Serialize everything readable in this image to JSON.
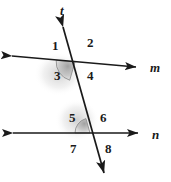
{
  "figure": {
    "canvas": {
      "width": 171,
      "height": 182
    },
    "background_color": "#ffffff",
    "stroke_color": "#1a1a1a",
    "shade_color": "#b9b9b9",
    "shade_edge_color": "#8c8c8c"
  },
  "lines": [
    {
      "id": "line-m",
      "label": "m",
      "label_x": 150,
      "label_y": 61,
      "x1": 12,
      "y1": 56,
      "x2": 136,
      "y2": 67,
      "arrow_start": true,
      "arrow_end": true
    },
    {
      "id": "line-n",
      "label": "n",
      "label_x": 152,
      "label_y": 128,
      "x1": 13,
      "y1": 133,
      "x2": 138,
      "y2": 133,
      "arrow_start": true,
      "arrow_end": true
    },
    {
      "id": "line-t",
      "label": "t",
      "label_x": 60,
      "label_y": 4,
      "x1": 63,
      "y1": 27,
      "x2": 104,
      "y2": 173,
      "arrow_start": true,
      "arrow_end": true
    }
  ],
  "intersections": [
    {
      "id": "intersection-upper",
      "x": 75,
      "y": 62,
      "lines": [
        "line-m",
        "line-t"
      ]
    },
    {
      "id": "intersection-lower",
      "x": 90,
      "y": 133,
      "lines": [
        "line-n",
        "line-t"
      ]
    }
  ],
  "angles": [
    {
      "id": "angle-1",
      "label": "1",
      "x": 52,
      "y": 39,
      "shaded": false,
      "vertex": "intersection-upper",
      "position": "upper-left"
    },
    {
      "id": "angle-2",
      "label": "2",
      "x": 87,
      "y": 36,
      "shaded": false,
      "vertex": "intersection-upper",
      "position": "upper-right"
    },
    {
      "id": "angle-3",
      "label": "3",
      "x": 54,
      "y": 69,
      "shaded": true,
      "vertex": "intersection-upper",
      "position": "lower-left"
    },
    {
      "id": "angle-4",
      "label": "4",
      "x": 87,
      "y": 69,
      "shaded": false,
      "vertex": "intersection-upper",
      "position": "lower-right"
    },
    {
      "id": "angle-5",
      "label": "5",
      "x": 69,
      "y": 111,
      "shaded": true,
      "vertex": "intersection-lower",
      "position": "upper-left"
    },
    {
      "id": "angle-6",
      "label": "6",
      "x": 100,
      "y": 111,
      "shaded": false,
      "vertex": "intersection-lower",
      "position": "upper-right"
    },
    {
      "id": "angle-7",
      "label": "7",
      "x": 70,
      "y": 142,
      "shaded": false,
      "vertex": "intersection-lower",
      "position": "lower-left"
    },
    {
      "id": "angle-8",
      "label": "8",
      "x": 105,
      "y": 142,
      "shaded": false,
      "vertex": "intersection-lower",
      "position": "lower-right"
    }
  ],
  "shaded_sectors": [
    {
      "id": "sector-angle-3",
      "angle_ref": "angle-3",
      "cx": 75,
      "cy": 62,
      "radius": 19,
      "start_deg": 175,
      "end_deg": 254
    },
    {
      "id": "sector-angle-5",
      "angle_ref": "angle-5",
      "cx": 90,
      "cy": 133,
      "radius": 15,
      "start_deg": 180,
      "end_deg": 254
    }
  ]
}
